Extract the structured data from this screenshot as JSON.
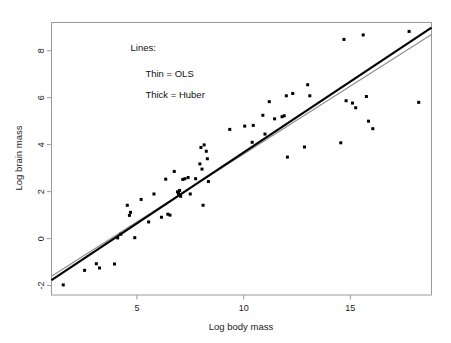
{
  "chart_data": {
    "type": "scatter",
    "title": "",
    "xlabel": "Log body mass",
    "ylabel": "Log brain mass",
    "xlim": [
      1.0,
      18.8
    ],
    "ylim": [
      -2.4,
      9.2
    ],
    "xticks": [
      5,
      10,
      15
    ],
    "xtick_labels": [
      "5",
      "10",
      "15"
    ],
    "yticks": [
      -2,
      0,
      2,
      4,
      6,
      8
    ],
    "ytick_labels": [
      "-2",
      "0",
      "2",
      "4",
      "6",
      "8"
    ],
    "grid": false,
    "legend_position": "none",
    "annotations": [
      {
        "text": "Lines:",
        "x": 4.7,
        "y": 8.0
      },
      {
        "text": "Thin = OLS",
        "x": 5.4,
        "y": 6.9
      },
      {
        "text": "Thick = Huber",
        "x": 5.4,
        "y": 6.0
      }
    ],
    "series": [
      {
        "name": "species",
        "marker": "square",
        "color": "#000000",
        "points": [
          [
            1.55,
            -1.97
          ],
          [
            2.55,
            -1.35
          ],
          [
            3.1,
            -1.07
          ],
          [
            3.25,
            -1.25
          ],
          [
            3.95,
            -1.08
          ],
          [
            4.1,
            0.03
          ],
          [
            4.25,
            0.19
          ],
          [
            4.55,
            1.42
          ],
          [
            4.65,
            0.99
          ],
          [
            4.7,
            1.12
          ],
          [
            4.9,
            0.04
          ],
          [
            5.2,
            1.67
          ],
          [
            5.55,
            0.71
          ],
          [
            5.8,
            1.9
          ],
          [
            6.15,
            0.91
          ],
          [
            6.35,
            2.53
          ],
          [
            6.45,
            1.04
          ],
          [
            6.55,
            1.0
          ],
          [
            6.75,
            2.86
          ],
          [
            6.9,
            1.99
          ],
          [
            6.95,
            1.92
          ],
          [
            7.0,
            2.05
          ],
          [
            7.05,
            1.8
          ],
          [
            7.15,
            2.52
          ],
          [
            7.25,
            2.55
          ],
          [
            7.4,
            2.6
          ],
          [
            7.5,
            1.9
          ],
          [
            7.75,
            2.55
          ],
          [
            7.95,
            3.18
          ],
          [
            8.0,
            3.88
          ],
          [
            8.05,
            2.96
          ],
          [
            8.1,
            1.42
          ],
          [
            8.15,
            3.99
          ],
          [
            8.25,
            3.72
          ],
          [
            8.3,
            3.4
          ],
          [
            8.35,
            2.43
          ],
          [
            9.35,
            4.65
          ],
          [
            10.05,
            4.79
          ],
          [
            10.4,
            4.1
          ],
          [
            10.45,
            4.82
          ],
          [
            10.9,
            5.25
          ],
          [
            11.0,
            4.45
          ],
          [
            11.2,
            5.83
          ],
          [
            11.45,
            5.1
          ],
          [
            11.8,
            5.19
          ],
          [
            11.9,
            5.23
          ],
          [
            12.0,
            6.08
          ],
          [
            12.05,
            3.47
          ],
          [
            12.3,
            6.18
          ],
          [
            12.85,
            3.9
          ],
          [
            13.0,
            6.55
          ],
          [
            13.1,
            6.08
          ],
          [
            14.55,
            4.08
          ],
          [
            14.7,
            8.48
          ],
          [
            14.8,
            5.87
          ],
          [
            15.1,
            5.77
          ],
          [
            15.25,
            5.57
          ],
          [
            15.6,
            8.67
          ],
          [
            15.75,
            6.05
          ],
          [
            15.85,
            5.0
          ],
          [
            16.05,
            4.68
          ],
          [
            17.75,
            8.82
          ],
          [
            18.2,
            5.8
          ]
        ]
      }
    ],
    "fits": [
      {
        "name": "OLS",
        "label": "Thin = OLS",
        "style": "thin",
        "color": "#8c8c8c",
        "width": 1.1,
        "intercept": -2.18,
        "slope": 0.578,
        "x_start": 1.0,
        "x_end": 18.8
      },
      {
        "name": "Huber",
        "label": "Thick = Huber",
        "style": "thick",
        "color": "#000000",
        "width": 2.2,
        "intercept": -2.37,
        "slope": 0.604,
        "x_start": 1.0,
        "x_end": 18.8
      }
    ]
  },
  "figure": {
    "background_color": "#ffffff",
    "frame_color": "#9a9a9a",
    "text_color": "#1a1a1a"
  }
}
